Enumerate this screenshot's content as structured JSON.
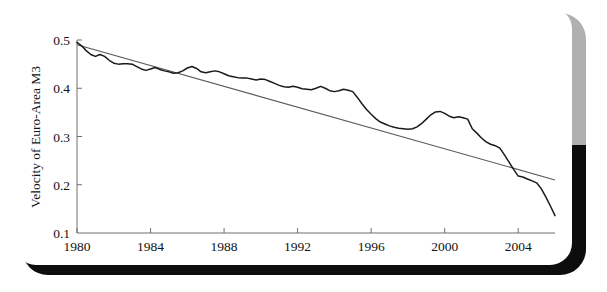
{
  "figure": {
    "background_color": "#ffffff",
    "frame_top_color": "#b0b0b0",
    "frame_bottom_color": "#0d0d0d",
    "card_color": "#ffffff"
  },
  "chart_data": {
    "type": "line",
    "title": "",
    "xlabel": "",
    "ylabel": "Velocity of Euro-Area M3",
    "xlim": [
      1980,
      2006
    ],
    "ylim": [
      0.1,
      0.5
    ],
    "grid": false,
    "legend": "none",
    "xticks": [
      1980,
      1984,
      1988,
      1992,
      1996,
      2000,
      2004
    ],
    "xticklabels": [
      "1980",
      "1984",
      "1988",
      "1992",
      "1996",
      "2000",
      "2004"
    ],
    "yticks": [
      0.1,
      0.2,
      0.3,
      0.4,
      0.5
    ],
    "yticklabels": [
      "0.1",
      "0.2",
      "0.3",
      "0.4",
      "0.5"
    ],
    "series": [
      {
        "name": "Velocity of Euro-Area M3",
        "kind": "data",
        "color": "#1a1a1a",
        "x": [
          1980.0,
          1980.25,
          1980.5,
          1980.75,
          1981.0,
          1981.25,
          1981.5,
          1981.75,
          1982.0,
          1982.25,
          1982.5,
          1982.75,
          1983.0,
          1983.25,
          1983.5,
          1983.75,
          1984.0,
          1984.25,
          1984.5,
          1984.75,
          1985.0,
          1985.25,
          1985.5,
          1985.75,
          1986.0,
          1986.25,
          1986.5,
          1986.75,
          1987.0,
          1987.25,
          1987.5,
          1987.75,
          1988.0,
          1988.25,
          1988.5,
          1988.75,
          1989.0,
          1989.25,
          1989.5,
          1989.75,
          1990.0,
          1990.25,
          1990.5,
          1990.75,
          1991.0,
          1991.25,
          1991.5,
          1991.75,
          1992.0,
          1992.25,
          1992.5,
          1992.75,
          1993.0,
          1993.25,
          1993.5,
          1993.75,
          1994.0,
          1994.25,
          1994.5,
          1994.75,
          1995.0,
          1995.25,
          1995.5,
          1995.75,
          1996.0,
          1996.25,
          1996.5,
          1996.75,
          1997.0,
          1997.25,
          1997.5,
          1997.75,
          1998.0,
          1998.25,
          1998.5,
          1998.75,
          1999.0,
          1999.25,
          1999.5,
          1999.75,
          2000.0,
          2000.25,
          2000.5,
          2000.75,
          2001.0,
          2001.25,
          2001.5,
          2001.75,
          2002.0,
          2002.25,
          2002.5,
          2002.75,
          2003.0,
          2003.25,
          2003.5,
          2003.75,
          2004.0,
          2004.25,
          2004.5,
          2004.75,
          2005.0,
          2005.25,
          2005.5,
          2005.75,
          2006.0
        ],
        "y": [
          0.495,
          0.488,
          0.478,
          0.47,
          0.466,
          0.47,
          0.466,
          0.458,
          0.452,
          0.45,
          0.451,
          0.451,
          0.45,
          0.445,
          0.44,
          0.437,
          0.44,
          0.443,
          0.439,
          0.436,
          0.434,
          0.431,
          0.432,
          0.436,
          0.442,
          0.445,
          0.441,
          0.434,
          0.432,
          0.434,
          0.436,
          0.434,
          0.43,
          0.426,
          0.424,
          0.422,
          0.421,
          0.421,
          0.419,
          0.417,
          0.419,
          0.418,
          0.414,
          0.41,
          0.406,
          0.403,
          0.402,
          0.404,
          0.402,
          0.399,
          0.398,
          0.397,
          0.4,
          0.404,
          0.4,
          0.395,
          0.393,
          0.395,
          0.398,
          0.396,
          0.393,
          0.381,
          0.368,
          0.356,
          0.346,
          0.337,
          0.33,
          0.326,
          0.322,
          0.319,
          0.317,
          0.316,
          0.315,
          0.316,
          0.32,
          0.327,
          0.336,
          0.345,
          0.351,
          0.352,
          0.348,
          0.342,
          0.339,
          0.341,
          0.339,
          0.336,
          0.333,
          0.334,
          0.337,
          0.336,
          0.333,
          0.334,
          0.337,
          0.334,
          0.329,
          0.324,
          0.32,
          0.316,
          0.312,
          0.31,
          0.311,
          0.312,
          0.313,
          0.318,
          0.32
        ],
        "x_tail": [
          2001.25,
          2001.5,
          2001.75,
          2002.0,
          2002.25,
          2002.5,
          2002.75,
          2003.0,
          2003.25,
          2003.5,
          2003.75,
          2004.0,
          2004.25,
          2004.5,
          2004.75,
          2005.0,
          2005.25,
          2005.5,
          2005.75,
          2006.0
        ],
        "y_tail": [
          0.32,
          0.316,
          0.307,
          0.297,
          0.289,
          0.284,
          0.281,
          0.276,
          0.262,
          0.247,
          0.232,
          0.218,
          0.216,
          0.212,
          0.208,
          0.204,
          0.192,
          0.175,
          0.156,
          0.136
        ]
      },
      {
        "name": "Linear trend",
        "kind": "trend",
        "color": "#5a5a5a",
        "x": [
          1980,
          2006
        ],
        "y": [
          0.49,
          0.21
        ]
      }
    ]
  }
}
